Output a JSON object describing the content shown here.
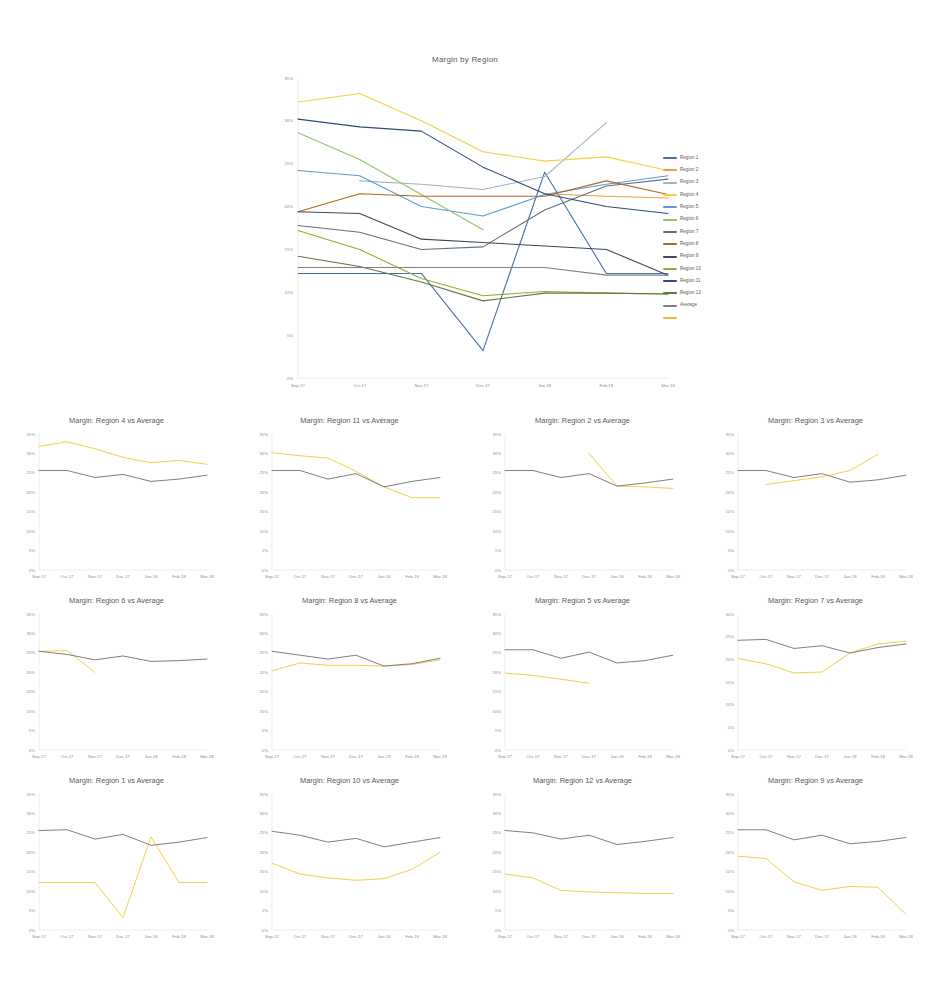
{
  "main": {
    "title": "Margin by Region",
    "legend": [
      {
        "label": "Region 1",
        "color": "#4a6fa5"
      },
      {
        "label": "Region 2",
        "color": "#e8a33d"
      },
      {
        "label": "Region 3",
        "color": "#a6b0c3"
      },
      {
        "label": "Region 4",
        "color": "#f5cf47"
      },
      {
        "label": "Region 5",
        "color": "#5b9bd5"
      },
      {
        "label": "Region 6",
        "color": "#92c46d"
      },
      {
        "label": "Region 7",
        "color": "#64707d"
      },
      {
        "label": "Region 8",
        "color": "#b5651d"
      },
      {
        "label": "Region 9",
        "color": "#3b4a54"
      },
      {
        "label": "Region 10",
        "color": "#9aa832"
      },
      {
        "label": "Region 11",
        "color": "#2e4a7d"
      },
      {
        "label": "Region 12",
        "color": "#5b7a44"
      },
      {
        "label": "Average",
        "color": "#7f7f7f"
      },
      {
        "label": "",
        "color": "#f5b642"
      }
    ]
  },
  "chart_data": [
    {
      "type": "line",
      "id": "main",
      "title": "Margin by Region",
      "xlabel": "",
      "ylabel": "",
      "x": [
        "Sep-17",
        "Oct-17",
        "Nov-17",
        "Dec-17",
        "Jan-18",
        "Feb-18",
        "Mar-18"
      ],
      "yticks": [
        "0%",
        "5%",
        "10%",
        "15%",
        "20%",
        "25%",
        "30%",
        "35%"
      ],
      "ylim": [
        0,
        35
      ],
      "grid": false,
      "legend_position": "right",
      "series": [
        {
          "name": "Region 1",
          "color": "#4a6fa5",
          "values": [
            12.2,
            12.2,
            12.2,
            3.2,
            24.0,
            12.2,
            12.2
          ]
        },
        {
          "name": "Region 2",
          "color": "#e8a33d",
          "values": [
            null,
            null,
            null,
            null,
            21.5,
            21.2,
            21.0
          ]
        },
        {
          "name": "Region 3",
          "color": "#a6b0c3",
          "values": [
            null,
            23.0,
            22.6,
            22.0,
            23.5,
            29.8,
            null
          ]
        },
        {
          "name": "Region 4",
          "color": "#f5cf47",
          "values": [
            32.2,
            33.2,
            30.0,
            26.4,
            25.3,
            25.8,
            24.2
          ]
        },
        {
          "name": "Region 5",
          "color": "#5b9bd5",
          "values": [
            24.2,
            23.6,
            20.0,
            18.9,
            21.4,
            22.6,
            23.6
          ]
        },
        {
          "name": "Region 6",
          "color": "#92c46d",
          "values": [
            28.6,
            25.5,
            21.4,
            17.3,
            null,
            null,
            null
          ]
        },
        {
          "name": "Region 7",
          "color": "#64707d",
          "values": [
            17.8,
            17.0,
            15.0,
            15.3,
            19.6,
            22.4,
            23.2
          ]
        },
        {
          "name": "Region 8",
          "color": "#b5651d",
          "values": [
            19.4,
            21.5,
            21.2,
            21.2,
            21.2,
            23.0,
            21.4
          ]
        },
        {
          "name": "Region 9",
          "color": "#3b4a54",
          "values": [
            19.4,
            19.2,
            16.2,
            15.8,
            15.4,
            15.0,
            12.0
          ]
        },
        {
          "name": "Region 10",
          "color": "#9aa832",
          "values": [
            17.2,
            15.0,
            11.6,
            9.6,
            10.1,
            9.9,
            9.8
          ]
        },
        {
          "name": "Region 11",
          "color": "#2e4a7d",
          "values": [
            30.2,
            29.3,
            28.8,
            24.6,
            21.5,
            20.0,
            19.2
          ]
        },
        {
          "name": "Region 12",
          "color": "#5b7a44",
          "values": [
            14.2,
            13.0,
            11.2,
            9.0,
            9.9,
            9.9,
            9.8
          ]
        },
        {
          "name": "Average",
          "color": "#7f7f7f",
          "values": [
            12.9,
            12.9,
            12.9,
            12.9,
            12.9,
            12.0,
            12.0
          ]
        }
      ]
    },
    {
      "type": "line",
      "id": "sm-r4",
      "title": "Margin: Region 4 vs Average",
      "x": [
        "Sep-17",
        "Oct-17",
        "Nov-17",
        "Dec-17",
        "Jan-18",
        "Feb-18",
        "Mar-18"
      ],
      "yticks": [
        "0%",
        "5%",
        "10%",
        "15%",
        "20%",
        "25%",
        "30%",
        "35%"
      ],
      "ylim": [
        0,
        35
      ],
      "series": [
        {
          "name": "Region 4",
          "color": "#f5cf47",
          "values": [
            31.8,
            33.0,
            31.2,
            29.0,
            27.6,
            28.2,
            27.2
          ]
        },
        {
          "name": "Average",
          "color": "#7f7f7f",
          "values": [
            25.6,
            25.6,
            23.8,
            24.6,
            22.8,
            23.4,
            24.4
          ]
        }
      ]
    },
    {
      "type": "line",
      "id": "sm-r11",
      "title": "Margin: Region 11 vs Average",
      "x": [
        "Sep-17",
        "Oct-17",
        "Nov-17",
        "Dec-17",
        "Jan-18",
        "Feb-18",
        "Mar-18"
      ],
      "yticks": [
        "0%",
        "5%",
        "10%",
        "15%",
        "20%",
        "25%",
        "30%",
        "35%"
      ],
      "ylim": [
        0,
        35
      ],
      "series": [
        {
          "name": "Region 11",
          "color": "#f5cf47",
          "values": [
            30.2,
            29.4,
            28.8,
            25.4,
            21.4,
            18.6,
            18.6
          ]
        },
        {
          "name": "Average",
          "color": "#7f7f7f",
          "values": [
            25.6,
            25.6,
            23.4,
            24.8,
            21.4,
            22.8,
            23.8
          ]
        }
      ]
    },
    {
      "type": "line",
      "id": "sm-r2",
      "title": "Margin: Region 2 vs Average",
      "x": [
        "Sep-17",
        "Oct-17",
        "Nov-17",
        "Dec-17",
        "Jan-18",
        "Feb-18",
        "Mar-18"
      ],
      "yticks": [
        "0%",
        "5%",
        "10%",
        "15%",
        "20%",
        "25%",
        "30%",
        "35%"
      ],
      "ylim": [
        0,
        35
      ],
      "series": [
        {
          "name": "Region 2",
          "color": "#f5cf47",
          "values": [
            null,
            null,
            null,
            30.0,
            21.6,
            21.4,
            21.0
          ]
        },
        {
          "name": "Average",
          "color": "#7f7f7f",
          "values": [
            25.6,
            25.6,
            23.8,
            24.8,
            21.6,
            22.4,
            23.4
          ]
        }
      ]
    },
    {
      "type": "line",
      "id": "sm-r3",
      "title": "Margin: Region 3 vs Average",
      "x": [
        "Sep-17",
        "Oct-17",
        "Nov-17",
        "Dec-17",
        "Jan-18",
        "Feb-18",
        "Mar-18"
      ],
      "yticks": [
        "0%",
        "5%",
        "10%",
        "15%",
        "20%",
        "25%",
        "30%",
        "35%"
      ],
      "ylim": [
        0,
        35
      ],
      "series": [
        {
          "name": "Region 3",
          "color": "#f5cf47",
          "values": [
            null,
            22.0,
            23.0,
            24.0,
            25.6,
            29.8,
            null
          ]
        },
        {
          "name": "Average",
          "color": "#7f7f7f",
          "values": [
            25.6,
            25.6,
            23.8,
            24.8,
            22.6,
            23.2,
            24.4
          ]
        }
      ]
    },
    {
      "type": "line",
      "id": "sm-r6",
      "title": "Margin: Region 6 vs Average",
      "x": [
        "Sep-17",
        "Oct-17",
        "Nov-17",
        "Dec-17",
        "Jan-18",
        "Feb-18",
        "Mar-18"
      ],
      "yticks": [
        "0%",
        "5%",
        "10%",
        "15%",
        "20%",
        "25%",
        "30%",
        "35%"
      ],
      "ylim": [
        0,
        35
      ],
      "series": [
        {
          "name": "Region 6",
          "color": "#f5cf47",
          "values": [
            25.4,
            25.6,
            20.0,
            null,
            null,
            null,
            null
          ]
        },
        {
          "name": "Average",
          "color": "#7f7f7f",
          "values": [
            25.4,
            24.6,
            23.2,
            24.2,
            22.8,
            23.0,
            23.4
          ]
        }
      ]
    },
    {
      "type": "line",
      "id": "sm-r8",
      "title": "Margin: Region 8 vs Average",
      "x": [
        "Sep-17",
        "Oct-17",
        "Nov-17",
        "Dec-17",
        "Jan-18",
        "Feb-18",
        "Mar-18"
      ],
      "yticks": [
        "0%",
        "5%",
        "10%",
        "15%",
        "20%",
        "25%",
        "30%",
        "35%"
      ],
      "ylim": [
        0,
        35
      ],
      "series": [
        {
          "name": "Region 8",
          "color": "#f5cf47",
          "values": [
            20.4,
            22.4,
            21.8,
            21.8,
            21.6,
            22.0,
            23.2
          ]
        },
        {
          "name": "Average",
          "color": "#7f7f7f",
          "values": [
            25.4,
            24.4,
            23.4,
            24.4,
            21.6,
            22.2,
            23.6
          ]
        }
      ]
    },
    {
      "type": "line",
      "id": "sm-r5",
      "title": "Margin: Region 5 vs Average",
      "x": [
        "Sep-17",
        "Oct-17",
        "Nov-17",
        "Dec-17",
        "Jan-18",
        "Feb-18",
        "Mar-18"
      ],
      "yticks": [
        "0%",
        "5%",
        "10%",
        "15%",
        "20%",
        "25%",
        "30%",
        "35%"
      ],
      "ylim": [
        0,
        35
      ],
      "series": [
        {
          "name": "Region 5",
          "color": "#f5cf47",
          "values": [
            19.8,
            19.2,
            18.2,
            17.2,
            null,
            null,
            null
          ]
        },
        {
          "name": "Average",
          "color": "#7f7f7f",
          "values": [
            25.8,
            25.8,
            23.6,
            25.2,
            22.4,
            23.0,
            24.4
          ]
        }
      ]
    },
    {
      "type": "line",
      "id": "sm-r7",
      "title": "Margin: Region 7 vs Average",
      "x": [
        "Sep-17",
        "Oct-17",
        "Nov-17",
        "Dec-17",
        "Jan-18",
        "Feb-18",
        "Mar-18"
      ],
      "yticks": [
        "0%",
        "5%",
        "10%",
        "15%",
        "20%",
        "25%",
        "30%"
      ],
      "ylim": [
        0,
        30
      ],
      "series": [
        {
          "name": "Region 7",
          "color": "#f5cf47",
          "values": [
            20.2,
            19.0,
            17.0,
            17.2,
            21.4,
            23.4,
            24.0
          ]
        },
        {
          "name": "Average",
          "color": "#7f7f7f",
          "values": [
            24.2,
            24.4,
            22.4,
            23.0,
            21.4,
            22.6,
            23.4
          ]
        }
      ]
    },
    {
      "type": "line",
      "id": "sm-r1",
      "title": "Margin: Region 1 vs Average",
      "x": [
        "Sep-17",
        "Oct-17",
        "Nov-17",
        "Dec-17",
        "Jan-18",
        "Feb-18",
        "Mar-18"
      ],
      "yticks": [
        "0%",
        "5%",
        "10%",
        "15%",
        "20%",
        "25%",
        "30%",
        "35%"
      ],
      "ylim": [
        0,
        35
      ],
      "series": [
        {
          "name": "Region 1",
          "color": "#f5cf47",
          "values": [
            12.2,
            12.2,
            12.2,
            3.2,
            24.0,
            12.2,
            12.2
          ]
        },
        {
          "name": "Average",
          "color": "#7f7f7f",
          "values": [
            25.6,
            25.8,
            23.4,
            24.6,
            21.8,
            22.6,
            23.8
          ]
        }
      ]
    },
    {
      "type": "line",
      "id": "sm-r10",
      "title": "Margin: Region 10 vs Average",
      "x": [
        "Sep-17",
        "Oct-17",
        "Nov-17",
        "Dec-17",
        "Jan-18",
        "Feb-18",
        "Mar-18"
      ],
      "yticks": [
        "0%",
        "5%",
        "10%",
        "15%",
        "20%",
        "25%",
        "30%",
        "35%"
      ],
      "ylim": [
        0,
        35
      ],
      "series": [
        {
          "name": "Region 10",
          "color": "#f5cf47",
          "values": [
            17.2,
            14.4,
            13.4,
            12.8,
            13.2,
            15.6,
            20.0
          ]
        },
        {
          "name": "Average",
          "color": "#7f7f7f",
          "values": [
            25.4,
            24.4,
            22.6,
            23.6,
            21.4,
            22.6,
            23.8
          ]
        }
      ]
    },
    {
      "type": "line",
      "id": "sm-r12",
      "title": "Margin: Region 12 vs Average",
      "x": [
        "Sep-17",
        "Oct-17",
        "Nov-17",
        "Dec-17",
        "Jan-18",
        "Feb-18",
        "Mar-18"
      ],
      "yticks": [
        "0%",
        "5%",
        "10%",
        "15%",
        "20%",
        "25%",
        "30%",
        "35%"
      ],
      "ylim": [
        0,
        35
      ],
      "series": [
        {
          "name": "Region 12",
          "color": "#f5cf47",
          "values": [
            14.4,
            13.4,
            10.2,
            9.8,
            9.6,
            9.4,
            9.4
          ]
        },
        {
          "name": "Average",
          "color": "#7f7f7f",
          "values": [
            25.6,
            25.0,
            23.4,
            24.4,
            22.0,
            22.8,
            23.8
          ]
        }
      ]
    },
    {
      "type": "line",
      "id": "sm-r9",
      "title": "Margin: Region 9 vs Average",
      "x": [
        "Sep-17",
        "Oct-17",
        "Nov-17",
        "Dec-17",
        "Jan-18",
        "Feb-18",
        "Mar-18"
      ],
      "yticks": [
        "0%",
        "5%",
        "10%",
        "15%",
        "20%",
        "25%",
        "30%",
        "35%"
      ],
      "ylim": [
        0,
        35
      ],
      "series": [
        {
          "name": "Region 9",
          "color": "#f5cf47",
          "values": [
            19.0,
            18.4,
            12.4,
            10.2,
            11.2,
            11.0,
            4.0
          ]
        },
        {
          "name": "Average",
          "color": "#7f7f7f",
          "values": [
            25.8,
            25.8,
            23.2,
            24.4,
            22.2,
            22.8,
            23.8
          ]
        }
      ]
    }
  ],
  "grid_layout": {
    "rows": [
      [
        "sm-r4",
        "sm-r11",
        "sm-r2",
        "sm-r3"
      ],
      [
        "sm-r6",
        "sm-r8",
        "sm-r5",
        "sm-r7"
      ],
      [
        "sm-r1",
        "sm-r10",
        "sm-r12",
        "sm-r9"
      ]
    ]
  }
}
